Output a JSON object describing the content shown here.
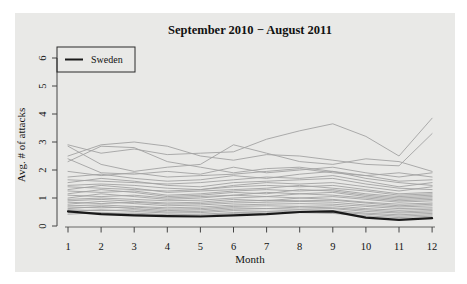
{
  "figure": {
    "title": "September 2010 − August 2011",
    "x_axis_label": "Month",
    "y_axis_label": "Avg. # of attacks",
    "legend": {
      "position": "top-left",
      "entries": [
        {
          "label": "Sweden",
          "color": "#1a1a1a"
        }
      ]
    },
    "colors": {
      "page_bg": "#ffffff",
      "panel_bg": "#e9e9e7",
      "highlight_line": "#1a1a1a",
      "other_lines": "#a3a3a3",
      "axis": "#444444",
      "text": "#111111"
    }
  },
  "chart_data": {
    "type": "line",
    "title": "September 2010 − August 2011",
    "xlabel": "Month",
    "ylabel": "Avg. # of attacks",
    "x": [
      1,
      2,
      3,
      4,
      5,
      6,
      7,
      8,
      9,
      10,
      11,
      12
    ],
    "x_tick_labels": [
      "1",
      "2",
      "3",
      "4",
      "5",
      "6",
      "7",
      "8",
      "9",
      "10",
      "11",
      "12"
    ],
    "y_ticks": [
      0,
      1,
      2,
      3,
      4,
      5,
      6
    ],
    "xlim": [
      1,
      12
    ],
    "ylim": [
      0,
      6.5
    ],
    "grid": false,
    "legend_position": "top-left",
    "series": [
      {
        "name": "Sweden",
        "role": "highlight",
        "color": "#1a1a1a",
        "width": 2.2,
        "values": [
          0.52,
          0.42,
          0.38,
          0.35,
          0.34,
          0.38,
          0.42,
          0.5,
          0.52,
          0.3,
          0.22,
          0.28
        ]
      },
      {
        "name": "other-01",
        "role": "background",
        "color": "#a3a3a3",
        "width": 0.9,
        "values": [
          2.9,
          2.6,
          2.75,
          2.55,
          2.6,
          2.65,
          3.1,
          3.4,
          3.65,
          3.2,
          2.5,
          3.85
        ]
      },
      {
        "name": "other-02",
        "role": "background",
        "color": "#a3a3a3",
        "width": 0.9,
        "values": [
          2.5,
          2.9,
          3.0,
          2.85,
          2.5,
          2.35,
          2.55,
          2.5,
          2.35,
          2.2,
          2.15,
          3.3
        ]
      },
      {
        "name": "other-03",
        "role": "background",
        "color": "#a3a3a3",
        "width": 0.9,
        "values": [
          2.85,
          2.2,
          1.95,
          2.1,
          2.2,
          2.9,
          2.6,
          2.3,
          2.2,
          2.4,
          2.3,
          1.95
        ]
      },
      {
        "name": "other-04",
        "role": "background",
        "color": "#a3a3a3",
        "width": 0.9,
        "values": [
          2.3,
          2.85,
          2.8,
          2.3,
          2.1,
          1.9,
          2.05,
          2.1,
          1.95,
          1.8,
          1.9,
          1.75
        ]
      },
      {
        "name": "other-05",
        "role": "background",
        "color": "#a3a3a3",
        "width": 0.9,
        "values": [
          2.4,
          1.9,
          1.85,
          1.95,
          1.85,
          2.1,
          1.9,
          2.0,
          2.1,
          1.9,
          1.75,
          1.9
        ]
      },
      {
        "name": "other-06",
        "role": "background",
        "color": "#a3a3a3",
        "width": 0.9,
        "values": [
          1.95,
          1.8,
          1.9,
          1.75,
          1.8,
          1.85,
          1.95,
          2.05,
          1.9,
          1.8,
          1.6,
          1.65
        ]
      },
      {
        "name": "other-07",
        "role": "background",
        "color": "#a3a3a3",
        "width": 0.9,
        "values": [
          1.75,
          1.85,
          1.7,
          1.6,
          1.65,
          1.8,
          1.7,
          1.85,
          1.95,
          1.7,
          1.55,
          1.45
        ]
      },
      {
        "name": "other-08",
        "role": "background",
        "color": "#a3a3a3",
        "width": 0.9,
        "values": [
          1.65,
          1.6,
          1.55,
          1.5,
          1.55,
          1.65,
          1.75,
          1.7,
          1.8,
          1.6,
          1.4,
          1.55
        ]
      },
      {
        "name": "other-09",
        "role": "background",
        "color": "#a3a3a3",
        "width": 0.9,
        "values": [
          1.55,
          1.7,
          1.6,
          1.45,
          1.4,
          1.55,
          1.6,
          1.65,
          1.7,
          1.5,
          1.35,
          1.3
        ]
      },
      {
        "name": "other-10",
        "role": "background",
        "color": "#a3a3a3",
        "width": 0.9,
        "values": [
          1.45,
          1.5,
          1.45,
          1.35,
          1.3,
          1.45,
          1.55,
          1.5,
          1.55,
          1.4,
          1.25,
          1.4
        ]
      },
      {
        "name": "other-11",
        "role": "background",
        "color": "#a3a3a3",
        "width": 0.9,
        "values": [
          1.4,
          1.35,
          1.3,
          1.25,
          1.3,
          1.4,
          1.45,
          1.4,
          1.45,
          1.3,
          1.15,
          1.2
        ]
      },
      {
        "name": "other-12",
        "role": "background",
        "color": "#a3a3a3",
        "width": 0.9,
        "values": [
          1.3,
          1.45,
          1.35,
          1.2,
          1.25,
          1.3,
          1.35,
          1.45,
          1.35,
          1.25,
          1.1,
          1.15
        ]
      },
      {
        "name": "other-13",
        "role": "background",
        "color": "#a3a3a3",
        "width": 0.9,
        "values": [
          1.25,
          1.2,
          1.25,
          1.1,
          1.15,
          1.25,
          1.3,
          1.25,
          1.3,
          1.15,
          1.05,
          1.1
        ]
      },
      {
        "name": "other-14",
        "role": "background",
        "color": "#a3a3a3",
        "width": 0.9,
        "values": [
          1.15,
          1.3,
          1.2,
          1.05,
          1.1,
          1.2,
          1.15,
          1.3,
          1.25,
          1.1,
          1.0,
          1.05
        ]
      },
      {
        "name": "other-15",
        "role": "background",
        "color": "#a3a3a3",
        "width": 0.9,
        "values": [
          1.1,
          1.05,
          1.1,
          1.0,
          1.05,
          1.1,
          1.2,
          1.15,
          1.2,
          1.05,
          0.95,
          1.0
        ]
      },
      {
        "name": "other-16",
        "role": "background",
        "color": "#a3a3a3",
        "width": 0.9,
        "values": [
          1.0,
          1.15,
          1.05,
          0.95,
          1.0,
          1.1,
          1.05,
          1.15,
          1.1,
          1.0,
          0.9,
          0.95
        ]
      },
      {
        "name": "other-17",
        "role": "background",
        "color": "#a3a3a3",
        "width": 0.9,
        "values": [
          0.95,
          1.0,
          0.95,
          0.9,
          0.92,
          1.0,
          1.05,
          1.0,
          1.05,
          0.95,
          0.85,
          0.9
        ]
      },
      {
        "name": "other-18",
        "role": "background",
        "color": "#a3a3a3",
        "width": 0.9,
        "values": [
          0.9,
          0.95,
          0.88,
          0.82,
          0.85,
          0.95,
          0.9,
          1.0,
          0.95,
          0.85,
          0.78,
          0.82
        ]
      },
      {
        "name": "other-19",
        "role": "background",
        "color": "#a3a3a3",
        "width": 0.9,
        "values": [
          0.85,
          0.8,
          0.85,
          0.78,
          0.8,
          0.88,
          0.92,
          0.9,
          0.92,
          0.82,
          0.72,
          0.78
        ]
      },
      {
        "name": "other-20",
        "role": "background",
        "color": "#a3a3a3",
        "width": 0.9,
        "values": [
          0.78,
          0.88,
          0.8,
          0.72,
          0.75,
          0.82,
          0.85,
          0.88,
          0.85,
          0.75,
          0.68,
          0.72
        ]
      },
      {
        "name": "other-21",
        "role": "background",
        "color": "#a3a3a3",
        "width": 0.9,
        "values": [
          0.72,
          0.75,
          0.7,
          0.65,
          0.68,
          0.75,
          0.78,
          0.8,
          0.78,
          0.7,
          0.62,
          0.65
        ]
      },
      {
        "name": "other-22",
        "role": "background",
        "color": "#a3a3a3",
        "width": 0.9,
        "values": [
          0.68,
          0.65,
          0.68,
          0.6,
          0.62,
          0.7,
          0.72,
          0.7,
          0.72,
          0.62,
          0.56,
          0.6
        ]
      },
      {
        "name": "other-23",
        "role": "background",
        "color": "#a3a3a3",
        "width": 0.9,
        "values": [
          0.62,
          0.7,
          0.62,
          0.55,
          0.58,
          0.65,
          0.62,
          0.68,
          0.65,
          0.58,
          0.5,
          0.55
        ]
      },
      {
        "name": "other-24",
        "role": "background",
        "color": "#a3a3a3",
        "width": 0.9,
        "values": [
          0.58,
          0.55,
          0.58,
          0.5,
          0.52,
          0.6,
          0.62,
          0.6,
          0.62,
          0.52,
          0.46,
          0.5
        ]
      },
      {
        "name": "other-25",
        "role": "background",
        "color": "#a3a3a3",
        "width": 0.9,
        "values": [
          0.52,
          0.58,
          0.52,
          0.46,
          0.48,
          0.55,
          0.52,
          0.58,
          0.55,
          0.46,
          0.4,
          0.45
        ]
      },
      {
        "name": "other-26",
        "role": "background",
        "color": "#a3a3a3",
        "width": 0.9,
        "values": [
          0.48,
          0.45,
          0.46,
          0.4,
          0.42,
          0.48,
          0.5,
          0.52,
          0.5,
          0.42,
          0.35,
          0.4
        ]
      },
      {
        "name": "other-27",
        "role": "background",
        "color": "#a3a3a3",
        "width": 0.9,
        "values": [
          0.42,
          0.48,
          0.42,
          0.36,
          0.38,
          0.44,
          0.42,
          0.48,
          0.45,
          0.36,
          0.3,
          0.35
        ]
      }
    ]
  }
}
